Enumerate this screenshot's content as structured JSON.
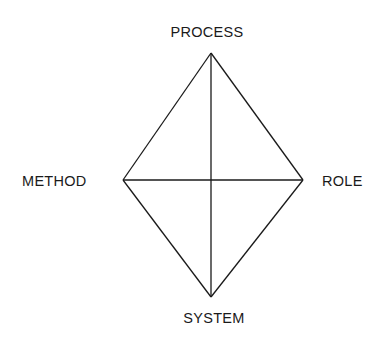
{
  "diagram": {
    "type": "diamond",
    "nodes": {
      "top": {
        "label": "PROCESS",
        "x": 211,
        "y": 53
      },
      "left": {
        "label": "METHOD",
        "x": 123,
        "y": 180
      },
      "right": {
        "label": "ROLE",
        "x": 303,
        "y": 180
      },
      "bottom": {
        "label": "SYSTEM",
        "x": 211,
        "y": 297
      }
    },
    "edges": [
      [
        "top",
        "left"
      ],
      [
        "top",
        "right"
      ],
      [
        "bottom",
        "left"
      ],
      [
        "bottom",
        "right"
      ],
      [
        "top",
        "bottom"
      ],
      [
        "left",
        "right"
      ]
    ],
    "line_color": "#1a1a1a",
    "background": "#ffffff"
  }
}
